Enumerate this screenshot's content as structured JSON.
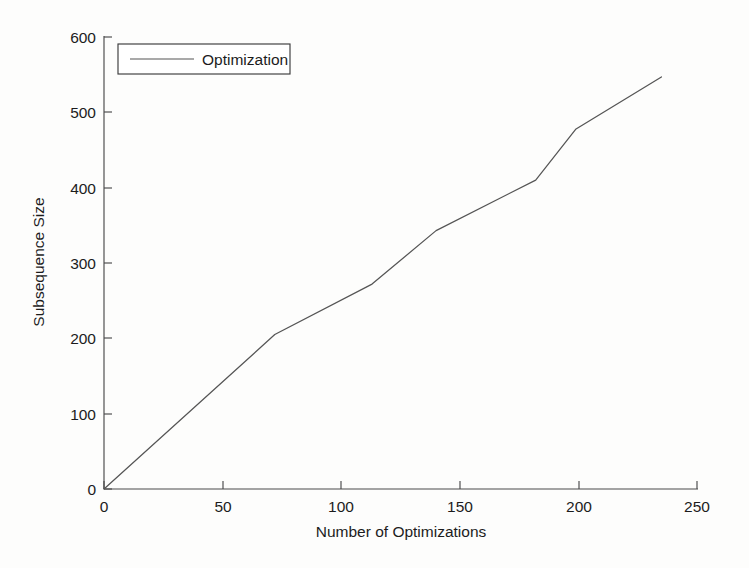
{
  "chart_data": {
    "type": "line",
    "title": "",
    "xlabel": "Number of Optimizations",
    "ylabel": "Subsequence Size",
    "xlim": [
      0,
      250
    ],
    "ylim": [
      0,
      600
    ],
    "xticks": [
      0,
      50,
      100,
      150,
      200,
      250
    ],
    "yticks": [
      0,
      100,
      200,
      300,
      400,
      500,
      600
    ],
    "xtick_labels": [
      "0",
      "50",
      "100",
      "150",
      "200",
      "250"
    ],
    "ytick_labels": [
      "0",
      "100",
      "200",
      "300",
      "400",
      "500",
      "600"
    ],
    "grid": false,
    "legend_position": "upper-left",
    "series": [
      {
        "name": "Optimization",
        "color": "#555555",
        "x": [
          0,
          72,
          113,
          140,
          182,
          199,
          235
        ],
        "y": [
          0,
          205,
          272,
          343,
          410,
          478,
          547
        ]
      }
    ]
  },
  "legend": {
    "entries": [
      {
        "label": "Optimization"
      }
    ]
  },
  "axes": {
    "x_title": "Number of Optimizations",
    "y_title": "Subsequence Size"
  }
}
